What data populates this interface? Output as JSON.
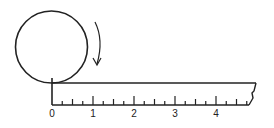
{
  "diagram": {
    "stroke_color": "#222222",
    "background": "#ffffff",
    "circle": {
      "cx": 51.5,
      "cy": 47,
      "r": 36
    },
    "rotation_arrow": {
      "direction": "clockwise"
    },
    "ruler": {
      "origin_x": 52,
      "unit_px": 41,
      "top_y": 83,
      "base_y": 105,
      "end_top_x": 256,
      "end_base_x": 249,
      "tick_heights": {
        "major": 9,
        "half": 6,
        "quarter": 4
      },
      "labels": [
        "0",
        "1",
        "2",
        "3",
        "4"
      ],
      "units": 4.75
    }
  }
}
